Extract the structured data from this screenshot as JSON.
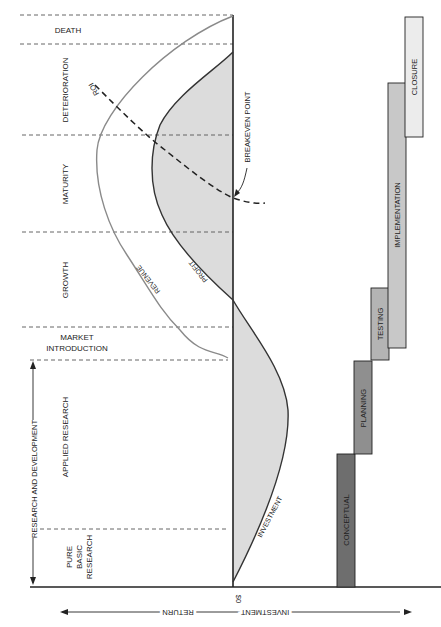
{
  "figure": {
    "colors": {
      "ink": "#222222",
      "curve_gray": "#8a8a8a",
      "fill_light": "#dcdcdc",
      "bar_conceptual": "#6e6e6e",
      "bar_planning": "#8f8f8f",
      "bar_testing": "#b4b4b4",
      "bar_implementation": "#c8c8c8",
      "bar_closure": "#ececec"
    }
  },
  "phases": [
    {
      "id": "death",
      "label": "DEATH"
    },
    {
      "id": "deterioration",
      "label": "DETERIORATION"
    },
    {
      "id": "maturity",
      "label": "MATURITY"
    },
    {
      "id": "growth",
      "label": "GROWTH"
    },
    {
      "id": "market-introduction",
      "label_line1": "MARKET",
      "label_line2": "INTRODUCTION"
    },
    {
      "id": "applied-research",
      "label": "APPLIED RESEARCH"
    },
    {
      "id": "pure-basic-research",
      "label_line1": "PURE",
      "label_line2": "BASIC",
      "label_line3": "RESEARCH"
    }
  ],
  "rd_span": {
    "label": "RESEARCH AND DEVELOPMENT"
  },
  "curves": {
    "revenue": "REVENUE",
    "profit": "PROFIT",
    "roi": "ROI",
    "investment": "INVESTMENT",
    "breakeven": "BREAKEVEN POINT"
  },
  "axis": {
    "zero_label": "$0",
    "return_label": "RETURN",
    "investment_label": "INVESTMENT"
  },
  "project_phases": [
    {
      "id": "conceptual",
      "label": "CONCEPTUAL"
    },
    {
      "id": "planning",
      "label": "PLANNING"
    },
    {
      "id": "testing",
      "label": "TESTING"
    },
    {
      "id": "implementation",
      "label": "IMPLEMENTATION"
    },
    {
      "id": "closure",
      "label": "CLOSURE"
    }
  ]
}
